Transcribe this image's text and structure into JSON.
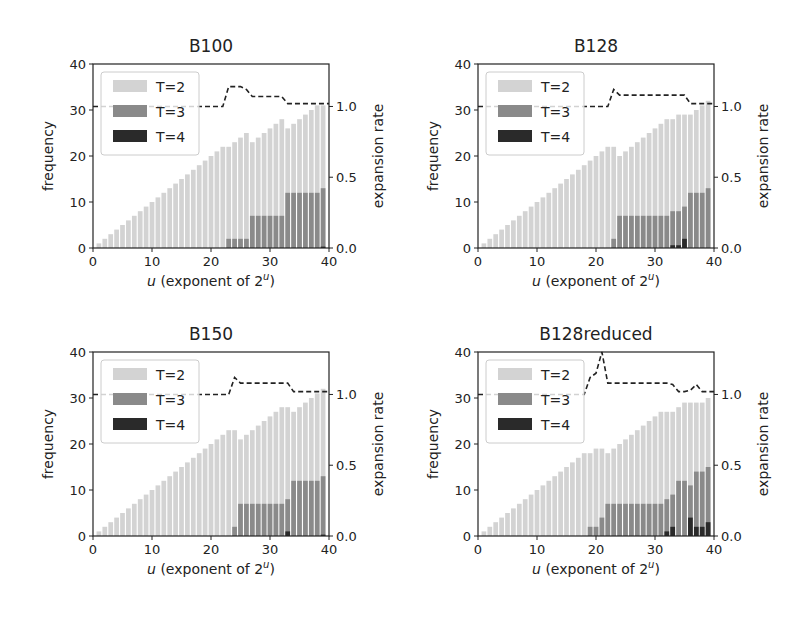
{
  "colors": {
    "t2": "#d3d3d3",
    "t3": "#8a8a8a",
    "t4": "#2a2a2a",
    "axis": "#222222",
    "line": "#222222"
  },
  "chart_data": [
    {
      "type": "bar",
      "title": "B100",
      "xlabel": "u (exponent of 2^u)",
      "ylabel": "frequency",
      "y2label": "expansion rate",
      "xlim": [
        0,
        40
      ],
      "ylim": [
        0,
        40
      ],
      "y2lim": [
        0.0,
        1.3
      ],
      "xticks": [
        0,
        10,
        20,
        30,
        40
      ],
      "yticks": [
        0,
        10,
        20,
        30,
        40
      ],
      "y2ticks": [
        0.0,
        0.5,
        1.0
      ],
      "legend": [
        "T=2",
        "T=3",
        "T=4"
      ],
      "legend_position": "upper left",
      "x": [
        1,
        2,
        3,
        4,
        5,
        6,
        7,
        8,
        9,
        10,
        11,
        12,
        13,
        14,
        15,
        16,
        17,
        18,
        19,
        20,
        21,
        22,
        23,
        24,
        25,
        26,
        27,
        28,
        29,
        30,
        31,
        32,
        33,
        34,
        35,
        36,
        37,
        38,
        39
      ],
      "series": [
        {
          "name": "T=2",
          "values": [
            1,
            2,
            3,
            4,
            5,
            6,
            7,
            8,
            9,
            10,
            11,
            12,
            13,
            14,
            15,
            16,
            17,
            18,
            19,
            20,
            21,
            22,
            22,
            23,
            24,
            25,
            23,
            24,
            25,
            26,
            27,
            28,
            26,
            27,
            28,
            29,
            30,
            31,
            31
          ]
        },
        {
          "name": "T=3",
          "values": [
            0,
            0,
            0,
            0,
            0,
            0,
            0,
            0,
            0,
            0,
            0,
            0,
            0,
            0,
            0,
            0,
            0,
            0,
            0,
            0,
            0,
            0,
            2,
            2,
            2,
            2,
            7,
            7,
            7,
            7,
            7,
            7,
            12,
            12,
            12,
            12,
            12,
            12,
            13
          ]
        },
        {
          "name": "T=4",
          "values": [
            0,
            0,
            0,
            0,
            0,
            0,
            0,
            0,
            0,
            0,
            0,
            0,
            0,
            0,
            0,
            0,
            0,
            0,
            0,
            0,
            0,
            0,
            0,
            0,
            0,
            0,
            0,
            0,
            0,
            0,
            0,
            0,
            0,
            0,
            0,
            0,
            0,
            0,
            0.3
          ]
        },
        {
          "name": "expansion rate",
          "type": "line",
          "axis": "right",
          "values": [
            1.0,
            1.0,
            1.0,
            1.0,
            1.0,
            1.0,
            1.0,
            1.0,
            1.0,
            1.0,
            1.0,
            1.0,
            1.0,
            1.0,
            1.0,
            1.0,
            1.0,
            1.0,
            1.0,
            1.0,
            1.0,
            1.0,
            1.14,
            1.14,
            1.14,
            1.12,
            1.07,
            1.07,
            1.07,
            1.07,
            1.07,
            1.07,
            1.02,
            1.02,
            1.02,
            1.02,
            1.02,
            1.02,
            1.02
          ]
        }
      ]
    },
    {
      "type": "bar",
      "title": "B128",
      "xlabel": "u (exponent of 2^u)",
      "ylabel": "frequency",
      "y2label": "expansion rate",
      "xlim": [
        0,
        40
      ],
      "ylim": [
        0,
        40
      ],
      "y2lim": [
        0.0,
        1.3
      ],
      "xticks": [
        0,
        10,
        20,
        30,
        40
      ],
      "yticks": [
        0,
        10,
        20,
        30,
        40
      ],
      "y2ticks": [
        0.0,
        0.5,
        1.0
      ],
      "legend": [
        "T=2",
        "T=3",
        "T=4"
      ],
      "legend_position": "upper left",
      "x": [
        1,
        2,
        3,
        4,
        5,
        6,
        7,
        8,
        9,
        10,
        11,
        12,
        13,
        14,
        15,
        16,
        17,
        18,
        19,
        20,
        21,
        22,
        23,
        24,
        25,
        26,
        27,
        28,
        29,
        30,
        31,
        32,
        33,
        34,
        35,
        36,
        37,
        38,
        39
      ],
      "series": [
        {
          "name": "T=2",
          "values": [
            1,
            2,
            3,
            4,
            5,
            6,
            7,
            8,
            9,
            10,
            11,
            12,
            13,
            14,
            15,
            16,
            17,
            18,
            19,
            20,
            21,
            22,
            22,
            20,
            21,
            22,
            23,
            24,
            25,
            26,
            27,
            28,
            28,
            29,
            29,
            29,
            30,
            31,
            32
          ]
        },
        {
          "name": "T=3",
          "values": [
            0,
            0,
            0,
            0,
            0,
            0,
            0,
            0,
            0,
            0,
            0,
            0,
            0,
            0,
            0,
            0,
            0,
            0,
            0,
            0,
            0,
            0,
            2,
            7,
            7,
            7,
            7,
            7,
            7,
            7,
            7,
            7,
            8,
            8,
            9,
            12,
            12,
            12,
            13
          ]
        },
        {
          "name": "T=4",
          "values": [
            0,
            0,
            0,
            0,
            0,
            0,
            0,
            0,
            0,
            0,
            0,
            0,
            0,
            0,
            0,
            0,
            0,
            0,
            0,
            0,
            0,
            0,
            0,
            0,
            0,
            0,
            0,
            0,
            0,
            0,
            0,
            0,
            0.6,
            0.6,
            2,
            0,
            0,
            0,
            0
          ]
        },
        {
          "name": "expansion rate",
          "type": "line",
          "axis": "right",
          "values": [
            1.0,
            1.0,
            1.0,
            1.0,
            1.0,
            1.0,
            1.0,
            1.0,
            1.0,
            1.0,
            1.0,
            1.0,
            1.0,
            1.0,
            1.0,
            1.0,
            1.0,
            1.0,
            1.0,
            1.0,
            1.0,
            1.0,
            1.12,
            1.08,
            1.08,
            1.08,
            1.08,
            1.08,
            1.08,
            1.08,
            1.08,
            1.08,
            1.08,
            1.08,
            1.08,
            1.02,
            1.02,
            1.02,
            1.02
          ]
        }
      ]
    },
    {
      "type": "bar",
      "title": "B150",
      "xlabel": "u (exponent of 2^u)",
      "ylabel": "frequency",
      "y2label": "expansion rate",
      "xlim": [
        0,
        40
      ],
      "ylim": [
        0,
        40
      ],
      "y2lim": [
        0.0,
        1.3
      ],
      "xticks": [
        0,
        10,
        20,
        30,
        40
      ],
      "yticks": [
        0,
        10,
        20,
        30,
        40
      ],
      "y2ticks": [
        0.0,
        0.5,
        1.0
      ],
      "legend": [
        "T=2",
        "T=3",
        "T=4"
      ],
      "legend_position": "upper left",
      "x": [
        1,
        2,
        3,
        4,
        5,
        6,
        7,
        8,
        9,
        10,
        11,
        12,
        13,
        14,
        15,
        16,
        17,
        18,
        19,
        20,
        21,
        22,
        23,
        24,
        25,
        26,
        27,
        28,
        29,
        30,
        31,
        32,
        33,
        34,
        35,
        36,
        37,
        38,
        39
      ],
      "series": [
        {
          "name": "T=2",
          "values": [
            1,
            2,
            3,
            4,
            5,
            6,
            7,
            8,
            9,
            10,
            11,
            12,
            13,
            14,
            15,
            16,
            17,
            18,
            19,
            20,
            21,
            22,
            23,
            23,
            21,
            22,
            23,
            24,
            25,
            26,
            27,
            28,
            28,
            27,
            28,
            29,
            30,
            31,
            32
          ]
        },
        {
          "name": "T=3",
          "values": [
            0,
            0,
            0,
            0,
            0,
            0,
            0,
            0,
            0,
            0,
            0,
            0,
            0,
            0,
            0,
            0,
            0,
            0,
            0,
            0,
            0,
            0,
            0,
            2,
            7,
            7,
            7,
            7,
            7,
            7,
            7,
            7,
            8,
            12,
            12,
            12,
            12,
            12,
            13
          ]
        },
        {
          "name": "T=4",
          "values": [
            0,
            0,
            0,
            0,
            0,
            0,
            0,
            0,
            0,
            0,
            0,
            0,
            0,
            0,
            0,
            0,
            0,
            0,
            0,
            0,
            0,
            0,
            0,
            0,
            0,
            0,
            0,
            0,
            0,
            0,
            0,
            0,
            1,
            0,
            0,
            0,
            0,
            0,
            0.3
          ]
        },
        {
          "name": "expansion rate",
          "type": "line",
          "axis": "right",
          "values": [
            1.0,
            1.0,
            1.0,
            1.0,
            1.0,
            1.0,
            1.0,
            1.0,
            1.0,
            1.0,
            1.0,
            1.0,
            1.0,
            1.0,
            1.0,
            1.0,
            1.0,
            1.0,
            1.0,
            1.0,
            1.0,
            1.0,
            1.0,
            1.12,
            1.08,
            1.08,
            1.08,
            1.08,
            1.08,
            1.08,
            1.08,
            1.08,
            1.08,
            1.02,
            1.02,
            1.02,
            1.02,
            1.02,
            1.02
          ]
        }
      ]
    },
    {
      "type": "bar",
      "title": "B128reduced",
      "xlabel": "u (exponent of 2^u)",
      "ylabel": "frequency",
      "y2label": "expansion rate",
      "xlim": [
        0,
        40
      ],
      "ylim": [
        0,
        40
      ],
      "y2lim": [
        0.0,
        1.3
      ],
      "xticks": [
        0,
        10,
        20,
        30,
        40
      ],
      "yticks": [
        0,
        10,
        20,
        30,
        40
      ],
      "y2ticks": [
        0.0,
        0.5,
        1.0
      ],
      "legend": [
        "T=2",
        "T=3",
        "T=4"
      ],
      "legend_position": "upper left",
      "x": [
        1,
        2,
        3,
        4,
        5,
        6,
        7,
        8,
        9,
        10,
        11,
        12,
        13,
        14,
        15,
        16,
        17,
        18,
        19,
        20,
        21,
        22,
        23,
        24,
        25,
        26,
        27,
        28,
        29,
        30,
        31,
        32,
        33,
        34,
        35,
        36,
        37,
        38,
        39
      ],
      "series": [
        {
          "name": "T=2",
          "values": [
            1,
            2,
            3,
            4,
            5,
            6,
            7,
            8,
            9,
            10,
            11,
            12,
            13,
            14,
            15,
            16,
            17,
            18,
            18,
            19,
            19,
            18,
            19,
            20,
            21,
            22,
            23,
            24,
            25,
            26,
            27,
            27,
            27,
            28,
            29,
            29,
            29,
            29,
            30
          ]
        },
        {
          "name": "T=3",
          "values": [
            0,
            0,
            0,
            0,
            0,
            0,
            0,
            0,
            0,
            0,
            0,
            0,
            0,
            0,
            0,
            0,
            0,
            0,
            2,
            2,
            4,
            7,
            7,
            7,
            7,
            7,
            7,
            7,
            7,
            7,
            7,
            8,
            9,
            12,
            12,
            11,
            14,
            14,
            15
          ]
        },
        {
          "name": "T=4",
          "values": [
            0,
            0,
            0,
            0,
            0,
            0,
            0,
            0,
            0,
            0,
            0,
            0,
            0,
            0,
            0,
            0,
            0,
            0,
            0,
            0,
            0,
            0,
            0,
            0,
            0,
            0,
            0,
            0,
            0,
            0,
            0,
            1,
            2,
            0,
            0,
            4,
            2,
            2,
            3
          ]
        },
        {
          "name": "expansion rate",
          "type": "line",
          "axis": "right",
          "values": [
            1.0,
            1.0,
            1.0,
            1.0,
            1.0,
            1.0,
            1.0,
            1.0,
            1.0,
            1.0,
            1.0,
            1.0,
            1.0,
            1.0,
            1.0,
            1.0,
            1.0,
            1.0,
            1.12,
            1.15,
            1.3,
            1.08,
            1.08,
            1.08,
            1.08,
            1.08,
            1.08,
            1.08,
            1.08,
            1.08,
            1.08,
            1.08,
            1.07,
            1.02,
            1.02,
            1.03,
            1.07,
            1.02,
            1.02
          ]
        }
      ]
    }
  ],
  "panels": [
    {
      "title": "B100",
      "xlabel_prefix": "u",
      "xlabel_rest": " (exponent of 2",
      "xlabel_sup": "u",
      "xlabel_end": ")",
      "ylabel": "frequency",
      "y2label": "expansion rate",
      "legend": [
        "T=2",
        "T=3",
        "T=4"
      ]
    },
    {
      "title": "B128",
      "xlabel_prefix": "u",
      "xlabel_rest": " (exponent of 2",
      "xlabel_sup": "u",
      "xlabel_end": ")",
      "ylabel": "frequency",
      "y2label": "expansion rate",
      "legend": [
        "T=2",
        "T=3",
        "T=4"
      ]
    },
    {
      "title": "B150",
      "xlabel_prefix": "u",
      "xlabel_rest": " (exponent of 2",
      "xlabel_sup": "u",
      "xlabel_end": ")",
      "ylabel": "frequency",
      "y2label": "expansion rate",
      "legend": [
        "T=2",
        "T=3",
        "T=4"
      ]
    },
    {
      "title": "B128reduced",
      "xlabel_prefix": "u",
      "xlabel_rest": " (exponent of 2",
      "xlabel_sup": "u",
      "xlabel_end": ")",
      "ylabel": "frequency",
      "y2label": "expansion rate",
      "legend": [
        "T=2",
        "T=3",
        "T=4"
      ]
    }
  ]
}
